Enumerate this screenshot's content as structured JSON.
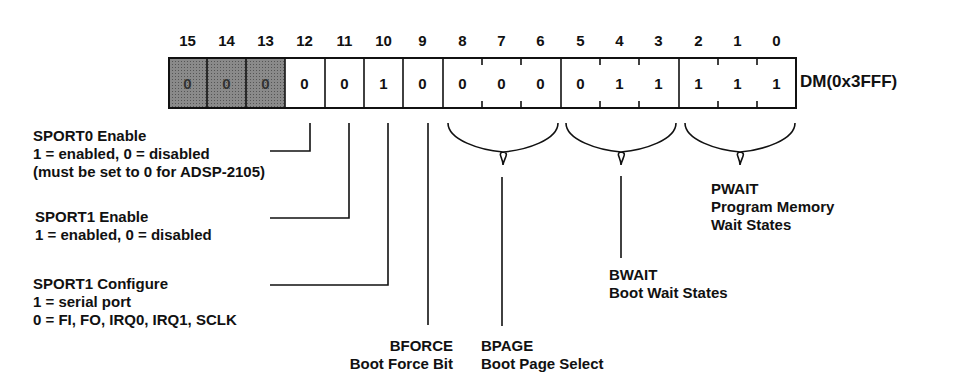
{
  "register": {
    "name": "DM(0x3FFF)",
    "bits": [
      {
        "num": "15",
        "value": "0",
        "shaded": true
      },
      {
        "num": "14",
        "value": "0",
        "shaded": true
      },
      {
        "num": "13",
        "value": "0",
        "shaded": true
      },
      {
        "num": "12",
        "value": "0",
        "shaded": false
      },
      {
        "num": "11",
        "value": "0",
        "shaded": false
      },
      {
        "num": "10",
        "value": "1",
        "shaded": false
      },
      {
        "num": "9",
        "value": "0",
        "shaded": false
      },
      {
        "num": "8",
        "value": "0",
        "shaded": false
      },
      {
        "num": "7",
        "value": "0",
        "shaded": false
      },
      {
        "num": "6",
        "value": "0",
        "shaded": false
      },
      {
        "num": "5",
        "value": "0",
        "shaded": false
      },
      {
        "num": "4",
        "value": "1",
        "shaded": false
      },
      {
        "num": "3",
        "value": "1",
        "shaded": false
      },
      {
        "num": "2",
        "value": "1",
        "shaded": false
      },
      {
        "num": "1",
        "value": "1",
        "shaded": false
      },
      {
        "num": "0",
        "value": "1",
        "shaded": false
      }
    ]
  },
  "fields": {
    "sport0": {
      "title": "SPORT0 Enable",
      "line1": "1 = enabled, 0 = disabled",
      "line2": "(must be set to 0 for ADSP-2105)"
    },
    "sport1_enable": {
      "title": "SPORT1 Enable",
      "line1": "1 = enabled, 0 = disabled"
    },
    "sport1_config": {
      "title": "SPORT1 Configure",
      "line1": "1 = serial port",
      "line2": "0 = FI, FO, IRQ0, IRQ1, SCLK"
    },
    "bforce": {
      "title": "BFORCE",
      "desc": "Boot Force Bit"
    },
    "bpage": {
      "title": "BPAGE",
      "desc": "Boot Page Select"
    },
    "bwait": {
      "title": "BWAIT",
      "desc": "Boot Wait States"
    },
    "pwait": {
      "title": "PWAIT",
      "line1": "Program Memory",
      "line2": "Wait States"
    }
  }
}
